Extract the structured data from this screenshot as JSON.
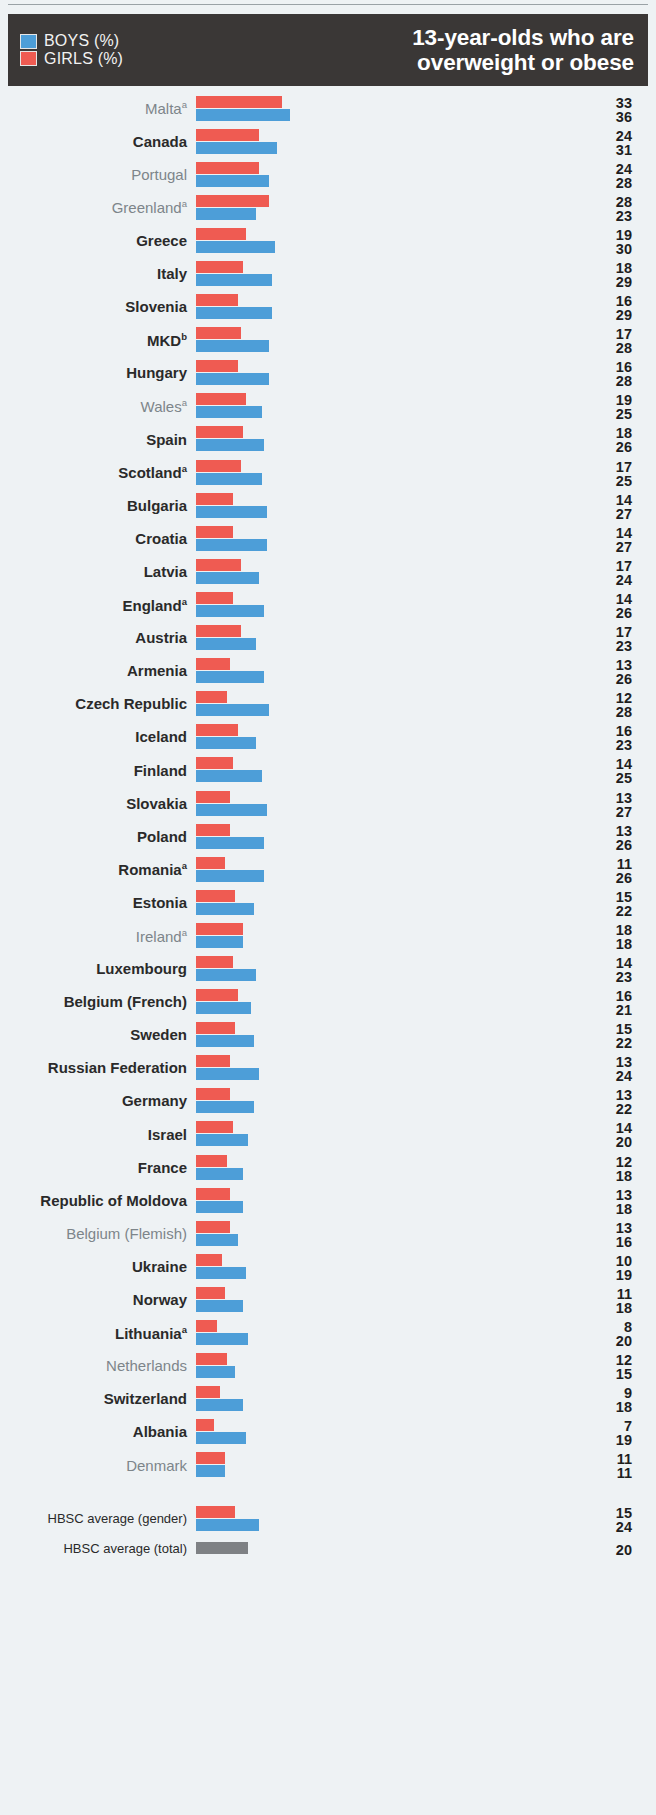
{
  "header": {
    "title_line1": "13-year-olds who are",
    "title_line2": "overweight or obese",
    "legend": [
      {
        "label": "BOYS (%)",
        "color": "#4d9ed8",
        "key": "boys"
      },
      {
        "label": "GIRLS (%)",
        "color": "#ef5b52",
        "key": "girls"
      }
    ]
  },
  "colors": {
    "boys": "#4d9ed8",
    "girls": "#ef5b52",
    "total": "#7e8184",
    "header_background": "#3a3736",
    "page_background": "#eef2f4"
  },
  "chart_data": {
    "type": "bar",
    "title": "13-year-olds who are overweight or obese",
    "orientation": "horizontal",
    "xlabel": "",
    "ylabel": "",
    "xlim": [
      0,
      40
    ],
    "grid": false,
    "legend_position": "top-left",
    "note": "Each country shows a paired horizontal bar: GIRLS (%) on top in red, BOYS (%) below in blue. Numeric labels at right list the girls value then the boys value.",
    "categories": [
      "Malta",
      "Canada",
      "Portugal",
      "Greenland",
      "Greece",
      "Italy",
      "Slovenia",
      "MKD",
      "Hungary",
      "Wales",
      "Spain",
      "Scotland",
      "Bulgaria",
      "Croatia",
      "Latvia",
      "England",
      "Austria",
      "Armenia",
      "Czech Republic",
      "Iceland",
      "Finland",
      "Slovakia",
      "Poland",
      "Romania",
      "Estonia",
      "Ireland",
      "Luxembourg",
      "Belgium (French)",
      "Sweden",
      "Russian Federation",
      "Germany",
      "Israel",
      "France",
      "Republic of Moldova",
      "Belgium (Flemish)",
      "Ukraine",
      "Norway",
      "Lithuania",
      "Netherlands",
      "Switzerland",
      "Albania",
      "Denmark"
    ],
    "series": [
      {
        "name": "GIRLS (%)",
        "color": "#ef5b52",
        "values": [
          33,
          24,
          24,
          28,
          19,
          18,
          16,
          17,
          16,
          19,
          18,
          17,
          14,
          14,
          17,
          14,
          17,
          13,
          12,
          16,
          14,
          13,
          13,
          11,
          15,
          18,
          14,
          16,
          15,
          13,
          13,
          14,
          12,
          13,
          13,
          10,
          11,
          8,
          12,
          9,
          7,
          11
        ]
      },
      {
        "name": "BOYS (%)",
        "color": "#4d9ed8",
        "values": [
          36,
          31,
          28,
          23,
          30,
          29,
          29,
          28,
          28,
          25,
          26,
          25,
          27,
          27,
          24,
          26,
          23,
          26,
          28,
          23,
          25,
          27,
          26,
          26,
          22,
          18,
          23,
          21,
          22,
          24,
          22,
          20,
          18,
          18,
          16,
          19,
          18,
          20,
          15,
          18,
          19,
          11
        ]
      }
    ],
    "averages": [
      {
        "label": "HBSC average (gender)",
        "girls": 15,
        "boys": 24
      },
      {
        "label": "HBSC average (total)",
        "total": 20
      }
    ]
  },
  "rows": [
    {
      "label": "Malta",
      "footnote": "a",
      "style": "muted",
      "girls": 33,
      "boys": 36
    },
    {
      "label": "Canada",
      "footnote": "",
      "style": "strong",
      "girls": 24,
      "boys": 31
    },
    {
      "label": "Portugal",
      "footnote": "",
      "style": "muted",
      "girls": 24,
      "boys": 28
    },
    {
      "label": "Greenland",
      "footnote": "a",
      "style": "muted",
      "girls": 28,
      "boys": 23
    },
    {
      "label": "Greece",
      "footnote": "",
      "style": "strong",
      "girls": 19,
      "boys": 30
    },
    {
      "label": "Italy",
      "footnote": "",
      "style": "strong",
      "girls": 18,
      "boys": 29
    },
    {
      "label": "Slovenia",
      "footnote": "",
      "style": "strong",
      "girls": 16,
      "boys": 29
    },
    {
      "label": "MKD",
      "footnote": "b",
      "style": "strong",
      "girls": 17,
      "boys": 28
    },
    {
      "label": "Hungary",
      "footnote": "",
      "style": "strong",
      "girls": 16,
      "boys": 28
    },
    {
      "label": "Wales",
      "footnote": "a",
      "style": "muted",
      "girls": 19,
      "boys": 25
    },
    {
      "label": "Spain",
      "footnote": "",
      "style": "strong",
      "girls": 18,
      "boys": 26
    },
    {
      "label": "Scotland",
      "footnote": "a",
      "style": "strong",
      "girls": 17,
      "boys": 25
    },
    {
      "label": "Bulgaria",
      "footnote": "",
      "style": "strong",
      "girls": 14,
      "boys": 27
    },
    {
      "label": "Croatia",
      "footnote": "",
      "style": "strong",
      "girls": 14,
      "boys": 27
    },
    {
      "label": "Latvia",
      "footnote": "",
      "style": "strong",
      "girls": 17,
      "boys": 24
    },
    {
      "label": "England",
      "footnote": "a",
      "style": "strong",
      "girls": 14,
      "boys": 26
    },
    {
      "label": "Austria",
      "footnote": "",
      "style": "strong",
      "girls": 17,
      "boys": 23
    },
    {
      "label": "Armenia",
      "footnote": "",
      "style": "strong",
      "girls": 13,
      "boys": 26
    },
    {
      "label": "Czech Republic",
      "footnote": "",
      "style": "strong",
      "girls": 12,
      "boys": 28
    },
    {
      "label": "Iceland",
      "footnote": "",
      "style": "strong",
      "girls": 16,
      "boys": 23
    },
    {
      "label": "Finland",
      "footnote": "",
      "style": "strong",
      "girls": 14,
      "boys": 25
    },
    {
      "label": "Slovakia",
      "footnote": "",
      "style": "strong",
      "girls": 13,
      "boys": 27
    },
    {
      "label": "Poland",
      "footnote": "",
      "style": "strong",
      "girls": 13,
      "boys": 26
    },
    {
      "label": "Romania",
      "footnote": "a",
      "style": "strong",
      "girls": 11,
      "boys": 26
    },
    {
      "label": "Estonia",
      "footnote": "",
      "style": "strong",
      "girls": 15,
      "boys": 22
    },
    {
      "label": "Ireland",
      "footnote": "a",
      "style": "muted",
      "girls": 18,
      "boys": 18
    },
    {
      "label": "Luxembourg",
      "footnote": "",
      "style": "strong",
      "girls": 14,
      "boys": 23
    },
    {
      "label": "Belgium (French)",
      "footnote": "",
      "style": "strong",
      "girls": 16,
      "boys": 21
    },
    {
      "label": "Sweden",
      "footnote": "",
      "style": "strong",
      "girls": 15,
      "boys": 22
    },
    {
      "label": "Russian Federation",
      "footnote": "",
      "style": "strong",
      "girls": 13,
      "boys": 24
    },
    {
      "label": "Germany",
      "footnote": "",
      "style": "strong",
      "girls": 13,
      "boys": 22
    },
    {
      "label": "Israel",
      "footnote": "",
      "style": "strong",
      "girls": 14,
      "boys": 20
    },
    {
      "label": "France",
      "footnote": "",
      "style": "strong",
      "girls": 12,
      "boys": 18
    },
    {
      "label": "Republic of Moldova",
      "footnote": "",
      "style": "strong",
      "girls": 13,
      "boys": 18
    },
    {
      "label": "Belgium (Flemish)",
      "footnote": "",
      "style": "muted",
      "girls": 13,
      "boys": 16
    },
    {
      "label": "Ukraine",
      "footnote": "",
      "style": "strong",
      "girls": 10,
      "boys": 19
    },
    {
      "label": "Norway",
      "footnote": "",
      "style": "strong",
      "girls": 11,
      "boys": 18
    },
    {
      "label": "Lithuania",
      "footnote": "a",
      "style": "strong",
      "girls": 8,
      "boys": 20
    },
    {
      "label": "Netherlands",
      "footnote": "",
      "style": "muted",
      "girls": 12,
      "boys": 15
    },
    {
      "label": "Switzerland",
      "footnote": "",
      "style": "strong",
      "girls": 9,
      "boys": 18
    },
    {
      "label": "Albania",
      "footnote": "",
      "style": "strong",
      "girls": 7,
      "boys": 19
    },
    {
      "label": "Denmark",
      "footnote": "",
      "style": "muted",
      "girls": 11,
      "boys": 11
    }
  ],
  "summary_rows": [
    {
      "label": "HBSC average (gender)",
      "girls": 15,
      "boys": 24
    },
    {
      "label": "HBSC average (total)",
      "total": 20
    }
  ]
}
